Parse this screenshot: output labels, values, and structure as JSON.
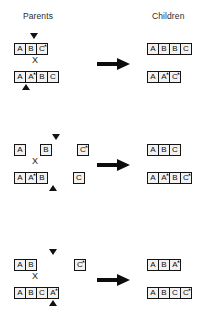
{
  "headers": {
    "parents": "Parents",
    "children": "Children"
  },
  "symbols": {
    "cross": "X",
    "arrow": "right-arrow",
    "crossover_marker_down": "down-triangle",
    "crossover_marker_up": "up-triangle",
    "mutation_mark": "*"
  },
  "colors": {
    "ink": "#111111",
    "box_fill": "#f2f2f2",
    "box_border": "#141414",
    "background": "#ffffff"
  },
  "blocks": [
    {
      "id": "block-1",
      "parent_a": {
        "genes": [
          {
            "label": "A",
            "star": false,
            "gap_after": "none"
          },
          {
            "label": "B",
            "star": false,
            "gap_after": "none"
          },
          {
            "label": "C",
            "star": true,
            "gap_after": "none"
          }
        ],
        "marker": {
          "type": "down-triangle",
          "left": 30,
          "top": 0
        }
      },
      "parent_b": {
        "genes": [
          {
            "label": "A",
            "star": false,
            "gap_after": "none"
          },
          {
            "label": "A",
            "star": true,
            "gap_after": "none"
          },
          {
            "label": "B",
            "star": false,
            "gap_after": "none"
          },
          {
            "label": "C",
            "star": false,
            "gap_after": "none"
          }
        ],
        "marker": {
          "type": "up-triangle",
          "left": 22,
          "top": 51
        }
      },
      "child_a": {
        "genes": [
          {
            "label": "A",
            "star": false,
            "gap_after": "none"
          },
          {
            "label": "B",
            "star": false,
            "gap_after": "none"
          },
          {
            "label": "B",
            "star": false,
            "gap_after": "none"
          },
          {
            "label": "C",
            "star": false,
            "gap_after": "none"
          }
        ]
      },
      "child_b": {
        "genes": [
          {
            "label": "A",
            "star": false,
            "gap_after": "none"
          },
          {
            "label": "A",
            "star": true,
            "gap_after": "none"
          },
          {
            "label": "C",
            "star": true,
            "gap_after": "none"
          }
        ]
      }
    },
    {
      "id": "block-2",
      "parent_a": {
        "genes": [
          {
            "label": "A",
            "star": false,
            "gap_after": "sm"
          },
          {
            "label": "B",
            "star": false,
            "gap_after": "md"
          },
          {
            "label": "C",
            "star": true,
            "gap_after": "none"
          }
        ],
        "marker": {
          "type": "down-triangle",
          "left": 52,
          "top": 0
        }
      },
      "parent_b": {
        "genes": [
          {
            "label": "A",
            "star": false,
            "gap_after": "none"
          },
          {
            "label": "A",
            "star": true,
            "gap_after": "none"
          },
          {
            "label": "B",
            "star": false,
            "gap_after": "md"
          },
          {
            "label": "C",
            "star": false,
            "gap_after": "none"
          }
        ],
        "marker": {
          "type": "up-triangle",
          "left": 49,
          "top": 51
        }
      },
      "child_a": {
        "genes": [
          {
            "label": "A",
            "star": false,
            "gap_after": "none"
          },
          {
            "label": "B",
            "star": false,
            "gap_after": "none"
          },
          {
            "label": "C",
            "star": false,
            "gap_after": "none"
          }
        ]
      },
      "child_b": {
        "genes": [
          {
            "label": "A",
            "star": false,
            "gap_after": "none"
          },
          {
            "label": "A",
            "star": true,
            "gap_after": "none"
          },
          {
            "label": "B",
            "star": false,
            "gap_after": "none"
          },
          {
            "label": "C",
            "star": true,
            "gap_after": "none"
          }
        ]
      }
    },
    {
      "id": "block-3",
      "parent_a": {
        "genes": [
          {
            "label": "A",
            "star": false,
            "gap_after": "none"
          },
          {
            "label": "B",
            "star": false,
            "gap_after": "lg"
          },
          {
            "label": "C",
            "star": true,
            "gap_after": "none"
          }
        ],
        "marker": {
          "type": "down-triangle",
          "left": 49,
          "top": 0
        }
      },
      "parent_b": {
        "genes": [
          {
            "label": "A",
            "star": false,
            "gap_after": "none"
          },
          {
            "label": "B",
            "star": false,
            "gap_after": "none"
          },
          {
            "label": "C",
            "star": false,
            "gap_after": "none"
          },
          {
            "label": "A",
            "star": true,
            "gap_after": "none"
          }
        ],
        "marker": {
          "type": "up-triangle",
          "left": 49,
          "top": 51
        }
      },
      "child_a": {
        "genes": [
          {
            "label": "A",
            "star": false,
            "gap_after": "none"
          },
          {
            "label": "B",
            "star": false,
            "gap_after": "none"
          },
          {
            "label": "A",
            "star": true,
            "gap_after": "none"
          }
        ]
      },
      "child_b": {
        "genes": [
          {
            "label": "A",
            "star": false,
            "gap_after": "none"
          },
          {
            "label": "B",
            "star": false,
            "gap_after": "none"
          },
          {
            "label": "C",
            "star": false,
            "gap_after": "none"
          },
          {
            "label": "C",
            "star": true,
            "gap_after": "none"
          }
        ]
      }
    }
  ]
}
